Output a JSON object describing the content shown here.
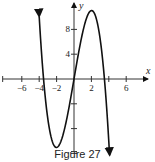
{
  "chart_data": {
    "type": "line",
    "title": "",
    "caption": "Figure 27",
    "xlabel": "x",
    "ylabel": "y",
    "xlim": [
      -8,
      8.5
    ],
    "ylim": [
      -12,
      12
    ],
    "x_ticks": [
      -6,
      -4,
      -2,
      2,
      4,
      6
    ],
    "x_tick_labels": [
      "-6",
      "-4",
      "-2",
      "2",
      "6"
    ],
    "y_ticks": [
      -12,
      -8,
      -4,
      4,
      8
    ],
    "y_tick_labels": [
      "4",
      "8"
    ],
    "grid": false,
    "legend": null,
    "series": [
      {
        "name": "f(x)",
        "description": "cubic with roots near -3.5, 0, 3.5; local min ≈ (-2, -11); local max ≈ (2, 11); arrows at both ends",
        "x": [
          -4,
          -3.5,
          -3,
          -2.5,
          -2,
          -1.5,
          -1,
          -0.5,
          0,
          0.5,
          1,
          1.5,
          2,
          2.5,
          3,
          3.5,
          4.1
        ],
        "y": [
          10.1,
          0,
          -6.5,
          -10.0,
          -11.0,
          -10.0,
          -7.5,
          -4.0,
          0,
          4.0,
          7.5,
          10.0,
          11.0,
          10.0,
          6.5,
          0,
          -12.0
        ]
      }
    ]
  },
  "figure": {
    "caption": "Figure 27",
    "x_axis_label": "x",
    "y_axis_label": "y"
  }
}
